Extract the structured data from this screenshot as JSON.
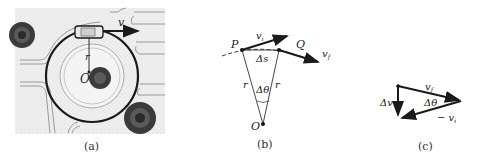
{
  "panels": [
    {
      "id": "a",
      "caption": "(a)",
      "labels": {
        "velocity": "v",
        "radius": "r",
        "center": "O"
      }
    },
    {
      "id": "b",
      "caption": "(b)",
      "labels": {
        "P": "P",
        "Q": "Q",
        "vi": "v",
        "vi_sub": "i",
        "vf": "v",
        "vf_sub": "f",
        "arc": "Δs",
        "angle": "Δθ",
        "r_left": "r",
        "r_right": "r",
        "center": "O"
      }
    },
    {
      "id": "c",
      "caption": "(c)",
      "labels": {
        "vf": "v",
        "vf_sub": "f",
        "dv": "Δv",
        "angle": "Δθ",
        "neg_vi": "− v",
        "neg_vi_sub": "i"
      }
    }
  ]
}
